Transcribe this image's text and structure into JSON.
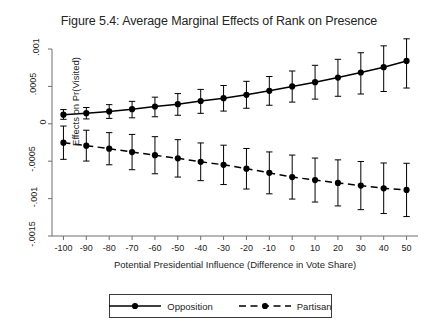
{
  "chart_data": {
    "type": "line",
    "title": "Figure 5.4: Average Marginal Effects of Rank on Presence",
    "xlabel": "Potential Presidential Influence (Difference in Vote Share)",
    "ylabel": "Effects on Pr(Visited)",
    "x": [
      -100,
      -90,
      -80,
      -70,
      -60,
      -50,
      -40,
      -30,
      -20,
      -10,
      0,
      10,
      20,
      30,
      40,
      50
    ],
    "xlim": [
      -105,
      55
    ],
    "ylim": [
      -0.0015,
      0.001
    ],
    "xticks": [
      -100,
      -90,
      -80,
      -70,
      -60,
      -50,
      -40,
      -30,
      -20,
      -10,
      0,
      10,
      20,
      30,
      40,
      50
    ],
    "xtick_labels": [
      "-100",
      "-90",
      "-80",
      "-70",
      "-60",
      "-50",
      "-40",
      "-30",
      "-20",
      "-10",
      "0",
      "10",
      "20",
      "30",
      "40",
      "50"
    ],
    "yticks": [
      0.001,
      0.0005,
      0,
      -0.0005,
      -0.001,
      -0.0015
    ],
    "ytick_labels": [
      ".001",
      ".0005",
      "0",
      "-.0005",
      "-.001",
      "-.0015"
    ],
    "grid": false,
    "legend_position": "below",
    "error_bars": "95% confidence interval",
    "series": [
      {
        "name": "Opposition",
        "line_style": "solid",
        "marker": "filled-circle",
        "color": "#000000",
        "values": [
          0.000122,
          0.000142,
          0.000166,
          0.000195,
          0.000231,
          0.000262,
          0.000305,
          0.000342,
          0.000388,
          0.000441,
          0.0005,
          0.000556,
          0.000618,
          0.000686,
          0.000757,
          0.00084
        ],
        "ci_lower": [
          6e-05,
          6.5e-05,
          7.2e-05,
          8e-05,
          9.4e-05,
          0.000114,
          0.00014,
          0.00017,
          0.000208,
          0.000248,
          0.00029,
          0.00033,
          0.000368,
          0.000398,
          0.000432,
          0.000478
        ],
        "ci_upper": [
          0.00019,
          0.000218,
          0.000256,
          0.0003,
          0.000356,
          0.000404,
          0.00046,
          0.000512,
          0.000568,
          0.000632,
          0.000706,
          0.000782,
          0.000862,
          0.00095,
          0.001042,
          0.001136
        ]
      },
      {
        "name": "Partisan",
        "line_style": "dashed",
        "marker": "filled-circle",
        "color": "#000000",
        "values": [
          -0.000252,
          -0.000292,
          -0.000332,
          -0.000378,
          -0.00042,
          -0.000462,
          -0.000508,
          -0.000548,
          -0.0006,
          -0.000656,
          -0.000712,
          -0.000752,
          -0.00079,
          -0.000826,
          -0.000862,
          -0.000884
        ],
        "ci_lower": [
          -0.000475,
          -0.000498,
          -0.000548,
          -0.000614,
          -0.000668,
          -0.000712,
          -0.00076,
          -0.000812,
          -0.000872,
          -0.000936,
          -0.001006,
          -0.001046,
          -0.001098,
          -0.001148,
          -0.0012,
          -0.00124
        ],
        "ci_upper": [
          -3e-05,
          -8.6e-05,
          -0.000118,
          -0.000142,
          -0.000172,
          -0.000212,
          -0.000256,
          -0.000286,
          -0.00033,
          -0.000376,
          -0.000418,
          -0.000458,
          -0.000482,
          -0.000504,
          -0.000524,
          -0.000528
        ]
      }
    ]
  }
}
